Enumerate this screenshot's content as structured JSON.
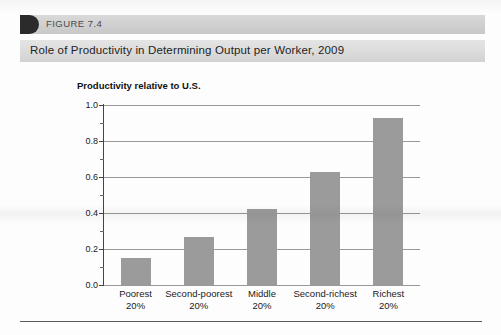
{
  "figure": {
    "number_label": "FIGURE 7.4",
    "title": "Role of Productivity in Determining Output per Worker, 2009",
    "tab_icon": "figure-tab-icon"
  },
  "colors": {
    "bar_fill": "#9b9b9b",
    "gridline": "#999999",
    "axis": "#444444",
    "title_band": "#dcdcdc",
    "figure_strip": "#cfcfcf",
    "figure_tab": "#2b2b2b",
    "text": "#1a1a1a"
  },
  "chart_data": {
    "type": "bar",
    "title": "Role of Productivity in Determining Output per Worker, 2009",
    "ylabel": "Productivity relative to U.S.",
    "xlabel": "",
    "categories": [
      "Poorest\n20%",
      "Second-poorest\n20%",
      "Middle\n20%",
      "Second-richest\n20%",
      "Richest\n20%"
    ],
    "category_lines": [
      {
        "line1": "Poorest",
        "line2": "20%"
      },
      {
        "line1": "Second-poorest",
        "line2": "20%"
      },
      {
        "line1": "Middle",
        "line2": "20%"
      },
      {
        "line1": "Second-richest",
        "line2": "20%"
      },
      {
        "line1": "Richest",
        "line2": "20%"
      }
    ],
    "values": [
      0.15,
      0.265,
      0.42,
      0.63,
      0.93
    ],
    "ylim": [
      0.0,
      1.0
    ],
    "ytick_labels": [
      "1.0",
      "0.8",
      "0.6",
      "0.4",
      "0.2",
      "0.0"
    ],
    "ytick_values": [
      1.0,
      0.8,
      0.6,
      0.4,
      0.2,
      0.0
    ],
    "yminor_values": [
      0.9,
      0.7,
      0.5,
      0.3,
      0.1
    ],
    "grid": true,
    "grid_axis": "y",
    "legend": null,
    "legend_position": "none",
    "bar_color": "#9b9b9b"
  }
}
